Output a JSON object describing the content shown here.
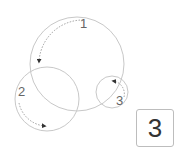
{
  "diagram": {
    "circles": [
      {
        "id": "1",
        "label": "1",
        "cx": 77,
        "cy": 64,
        "r": 47
      },
      {
        "id": "2",
        "label": "2",
        "cx": 47,
        "cy": 99,
        "r": 32
      },
      {
        "id": "3",
        "label": "3",
        "cx": 112,
        "cy": 92,
        "r": 16
      }
    ],
    "stroke_color": "#c8c8c8",
    "arrow_color": "#333333"
  },
  "labels": {
    "one": "1",
    "two": "2",
    "three": "3"
  },
  "answer": {
    "value": "3"
  }
}
